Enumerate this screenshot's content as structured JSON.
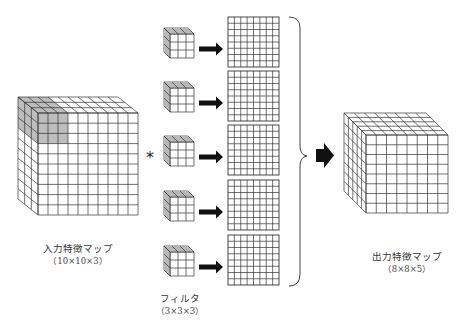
{
  "diagram": {
    "input_map": {
      "label": "入力特徴マップ",
      "dims": "（10×10×3）",
      "width": 10,
      "height": 10,
      "depth": 3,
      "highlight": {
        "rows": 3,
        "cols": 3,
        "color": "#bdbdbd"
      }
    },
    "operator": "*",
    "filters": {
      "label": "フィルタ",
      "dims": "（3×3×3）",
      "count": 5,
      "size": 3
    },
    "intermediate_maps": {
      "count": 5,
      "width": 8,
      "height": 8
    },
    "output_map": {
      "label": "出力特徴マップ",
      "dims": "（8×8×5）",
      "width": 8,
      "height": 8,
      "depth": 5
    },
    "colors": {
      "line": "#333333",
      "highlight": "#bdbdbd",
      "arrow": "#111111",
      "background": "#ffffff"
    }
  }
}
